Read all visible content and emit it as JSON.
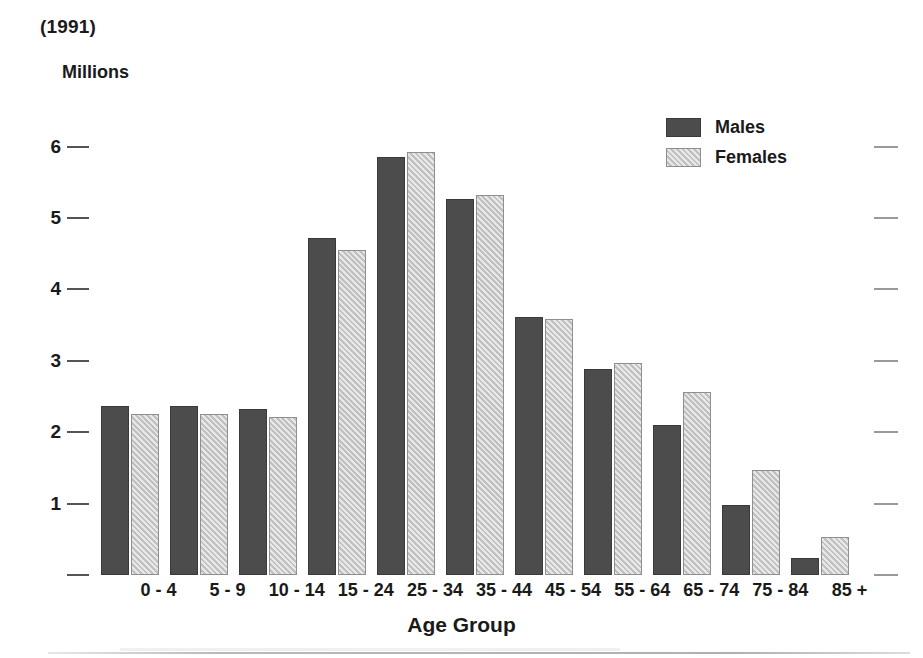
{
  "title": "(1991)",
  "axis": {
    "y_label": "Millions",
    "x_title": "Age Group",
    "y_ticks": [
      "6",
      "5",
      "4",
      "3",
      "2",
      "1",
      ""
    ],
    "y_tick_values": [
      6,
      5,
      4,
      3,
      2,
      1,
      0
    ]
  },
  "legend": {
    "items": [
      {
        "label": "Males",
        "color": "#4c4c4c"
      },
      {
        "label": "Females",
        "color": "#cccccc"
      }
    ]
  },
  "colors": {
    "males": "#4c4c4c",
    "females": "#cccccc",
    "text": "#1a1a1a",
    "tick": "#555555",
    "right_tick": "#9a9a9a",
    "background": "#ffffff"
  },
  "chart_data": {
    "type": "bar",
    "title": "(1991)",
    "xlabel": "Age Group",
    "ylabel": "Millions",
    "ylim": [
      0,
      6.4
    ],
    "yticks": [
      0,
      1,
      2,
      3,
      4,
      5,
      6
    ],
    "grid": false,
    "legend_position": "top-right",
    "categories": [
      "0 - 4",
      "5 - 9",
      "10 - 14",
      "15 - 24",
      "25 - 34",
      "35 - 44",
      "45 - 54",
      "55 - 64",
      "65 - 74",
      "75 - 84",
      "85 +"
    ],
    "series": [
      {
        "name": "Males",
        "color": "#4c4c4c",
        "values": [
          2.37,
          2.37,
          2.33,
          4.72,
          5.86,
          5.26,
          3.61,
          2.88,
          2.1,
          0.98,
          0.24
        ]
      },
      {
        "name": "Females",
        "color": "#cccccc",
        "values": [
          2.25,
          2.25,
          2.21,
          4.55,
          5.92,
          5.32,
          3.59,
          2.97,
          2.56,
          1.47,
          0.53
        ]
      }
    ]
  }
}
